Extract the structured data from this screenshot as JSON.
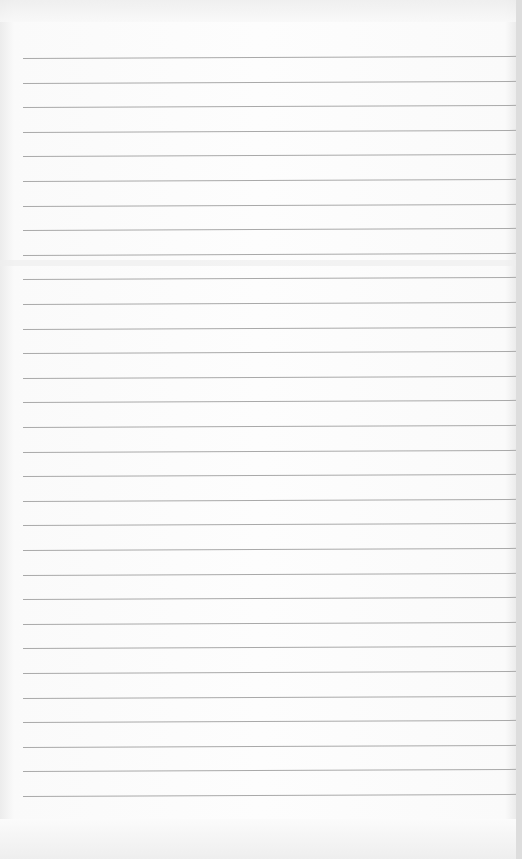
{
  "document": {
    "type": "ruled-paper",
    "text_content": "",
    "line_count": 31,
    "first_line_y": 58,
    "line_spacing": 24.6,
    "line_color": "#a9a9a9",
    "paper_color": "#fdfdfd"
  }
}
